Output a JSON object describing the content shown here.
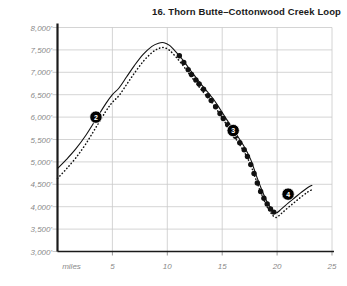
{
  "chart_data": {
    "type": "line",
    "title": "16. Thorn Butte–Cottonwood Creek Loop",
    "xlabel": "miles",
    "ylabel": "",
    "xlim": [
      0,
      25
    ],
    "ylim": [
      3000,
      8000
    ],
    "grid": true,
    "legend": false,
    "x_ticks": [
      5,
      10,
      15,
      20,
      25
    ],
    "x_tick_labels": [
      "5",
      "10",
      "15",
      "20",
      "25"
    ],
    "x_origin_label": "miles",
    "y_ticks": [
      3000,
      3500,
      4000,
      4500,
      5000,
      5500,
      6000,
      6500,
      7000,
      7500,
      8000
    ],
    "y_tick_labels": [
      "3,000'",
      "3,500'",
      "4,000'",
      "4,500'",
      "5,000'",
      "5,500'",
      "6,000'",
      "6,500'",
      "7,000'",
      "7,500'",
      "8,000'"
    ],
    "series": [
      {
        "name": "elevation-profile",
        "style": "solid",
        "x": [
          0.0,
          0.8,
          1.7,
          2.6,
          3.5,
          4.4,
          5.0,
          5.6,
          6.3,
          7.0,
          7.8,
          8.6,
          9.2,
          9.7,
          10.2,
          10.8,
          11.4,
          12.0,
          12.5,
          13.0,
          13.6,
          14.2,
          14.8,
          15.4,
          16.0,
          16.6,
          17.1,
          17.6,
          18.1,
          18.6,
          19.1,
          19.5,
          19.9,
          20.4,
          21.0,
          21.6,
          22.2,
          22.8,
          23.2
        ],
        "y": [
          4850,
          5050,
          5300,
          5600,
          5950,
          6300,
          6500,
          6650,
          6900,
          7150,
          7400,
          7580,
          7650,
          7660,
          7600,
          7450,
          7280,
          7080,
          6920,
          6760,
          6580,
          6400,
          6180,
          5950,
          5720,
          5500,
          5300,
          5050,
          4700,
          4380,
          4100,
          3950,
          3860,
          3950,
          4080,
          4200,
          4320,
          4430,
          4480
        ]
      },
      {
        "name": "elevation-profile-dotted-parallel",
        "style": "dotted",
        "x": [
          0.0,
          0.8,
          1.7,
          2.6,
          3.5,
          4.4,
          5.0,
          5.6,
          6.3,
          7.0,
          7.8,
          8.6,
          9.2,
          9.7,
          10.2,
          10.8,
          11.4,
          12.0,
          12.5,
          13.0,
          13.6,
          14.2,
          14.8,
          15.4,
          16.0,
          16.6,
          17.1,
          17.6,
          18.1,
          18.6,
          19.1,
          19.5,
          19.9,
          20.4,
          21.0,
          21.6,
          22.2,
          22.8,
          23.2
        ],
        "y": [
          4630,
          4840,
          5100,
          5410,
          5770,
          6130,
          6330,
          6480,
          6730,
          6980,
          7240,
          7440,
          7530,
          7550,
          7490,
          7340,
          7160,
          6960,
          6800,
          6640,
          6460,
          6280,
          6060,
          5830,
          5600,
          5380,
          5180,
          4930,
          4590,
          4270,
          3990,
          3840,
          3760,
          3850,
          3980,
          4100,
          4220,
          4330,
          4380
        ]
      },
      {
        "name": "dotted-segment-markers",
        "style": "large-dots",
        "x": [
          11.1,
          11.5,
          11.9,
          12.2,
          12.6,
          12.9,
          13.3,
          13.7,
          14.0,
          14.4,
          14.8,
          15.1,
          15.5,
          15.9,
          16.2,
          16.6,
          17.0,
          17.3,
          17.6,
          17.9,
          18.2,
          18.5,
          18.8,
          19.1,
          19.4,
          19.7
        ],
        "y": [
          7370,
          7220,
          7060,
          6950,
          6830,
          6740,
          6620,
          6480,
          6370,
          6230,
          6080,
          5970,
          5830,
          5680,
          5570,
          5430,
          5270,
          5120,
          4940,
          4740,
          4530,
          4340,
          4190,
          4060,
          3950,
          3880
        ]
      }
    ],
    "annotations": [
      {
        "label": "2",
        "x": 3.5,
        "y": 6000,
        "shape": "filled-circle-badge"
      },
      {
        "label": "3",
        "x": 16.0,
        "y": 5700,
        "shape": "filled-circle-badge"
      },
      {
        "label": "4",
        "x": 21.0,
        "y": 4280,
        "shape": "filled-circle-badge"
      }
    ],
    "colors": {
      "line": "#111111",
      "grid": "#c9c9c9",
      "axis": "#1a1a1a",
      "tick_label": "#8a8a8a",
      "title": "#1a1a1a",
      "badge_fill": "#000000",
      "badge_text": "#ffffff",
      "background": "#ffffff"
    }
  }
}
